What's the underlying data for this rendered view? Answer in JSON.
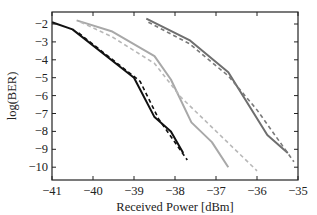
{
  "chart_data": {
    "type": "line",
    "title": "",
    "xlabel": "Received Power [dBm]",
    "ylabel": "log(BER)",
    "xlim": [
      -41,
      -35
    ],
    "ylim": [
      -10.6,
      -1.4
    ],
    "xticks": [
      -41,
      -40,
      -39,
      -38,
      -37,
      -36,
      -35
    ],
    "yticks": [
      -2,
      -3,
      -4,
      -5,
      -6,
      -7,
      -8,
      -9,
      -10
    ],
    "grid": false,
    "legend": null,
    "series": [
      {
        "name": "black solid",
        "color": "#111111",
        "dash": false,
        "x": [
          -41.0,
          -40.5,
          -39.0,
          -38.5,
          -38.1,
          -37.8
        ],
        "y": [
          -1.9,
          -2.3,
          -5.0,
          -7.2,
          -8.0,
          -9.2
        ]
      },
      {
        "name": "black dashed",
        "color": "#111111",
        "dash": true,
        "x": [
          -40.35,
          -38.85,
          -38.4,
          -37.7
        ],
        "y": [
          -2.5,
          -5.2,
          -7.3,
          -9.6
        ]
      },
      {
        "name": "light gray solid",
        "color": "#a8a8a8",
        "dash": false,
        "x": [
          -40.4,
          -39.55,
          -38.5,
          -38.1,
          -37.6,
          -37.1,
          -36.7
        ],
        "y": [
          -1.8,
          -2.4,
          -3.8,
          -5.1,
          -7.5,
          -8.6,
          -10.0
        ]
      },
      {
        "name": "light gray dashed",
        "color": "#b8b8b8",
        "dash": true,
        "x": [
          -40.3,
          -39.55,
          -38.5,
          -37.85,
          -36.0
        ],
        "y": [
          -1.9,
          -2.7,
          -4.2,
          -6.1,
          -10.2
        ]
      },
      {
        "name": "dark gray solid",
        "color": "#6e6e6e",
        "dash": false,
        "x": [
          -38.7,
          -37.65,
          -36.7,
          -35.75,
          -35.25
        ],
        "y": [
          -1.7,
          -2.9,
          -4.7,
          -8.2,
          -9.2
        ]
      },
      {
        "name": "dark gray dashed",
        "color": "#7a7a7a",
        "dash": true,
        "x": [
          -38.65,
          -37.65,
          -36.7,
          -36.0,
          -35.1
        ],
        "y": [
          -1.9,
          -3.1,
          -4.9,
          -6.8,
          -9.7
        ]
      }
    ]
  }
}
